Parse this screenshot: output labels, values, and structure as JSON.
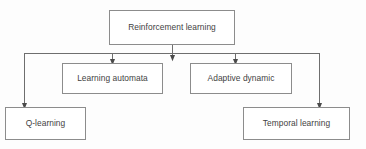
{
  "diagram": {
    "type": "tree-hierarchy-flowchart",
    "colors": {
      "background": "#fdfdfd",
      "node_fill": "#ffffff",
      "node_border": "#8c8c8c",
      "text": "#3f3f3f",
      "edge": "#6e6e6e"
    },
    "nodes": [
      {
        "id": "root",
        "label": "Reinforcement learning",
        "level": 0,
        "x": 109,
        "y": 10,
        "width": 126,
        "height": 35
      },
      {
        "id": "learning-automata",
        "label": "Learning automata",
        "level": 1,
        "x": 62,
        "y": 63,
        "width": 101,
        "height": 31
      },
      {
        "id": "adaptive-dynamic",
        "label": "Adaptive dynamic",
        "level": 1,
        "x": 190,
        "y": 63,
        "width": 102,
        "height": 31
      },
      {
        "id": "q-learning",
        "label": "Q-learning",
        "level": 1,
        "x": 5,
        "y": 107,
        "width": 81,
        "height": 33
      },
      {
        "id": "temporal-learning",
        "label": "Temporal learning",
        "level": 1,
        "x": 243,
        "y": 107,
        "width": 107,
        "height": 33
      }
    ],
    "edges": [
      {
        "id": "root-to-bus",
        "from": "root",
        "to": "bus",
        "arrow": true
      },
      {
        "id": "bus-to-q-learning",
        "from": "bus",
        "to": "q-learning",
        "arrow": true
      },
      {
        "id": "bus-to-learning-automata",
        "from": "bus",
        "to": "learning-automata",
        "arrow": true
      },
      {
        "id": "bus-to-adaptive-dynamic",
        "from": "bus",
        "to": "adaptive-dynamic",
        "arrow": true
      },
      {
        "id": "bus-to-temporal-learning",
        "from": "bus",
        "to": "temporal-learning",
        "arrow": true
      }
    ],
    "bus": {
      "y": 53,
      "x_left": 24,
      "x_right": 320
    }
  }
}
